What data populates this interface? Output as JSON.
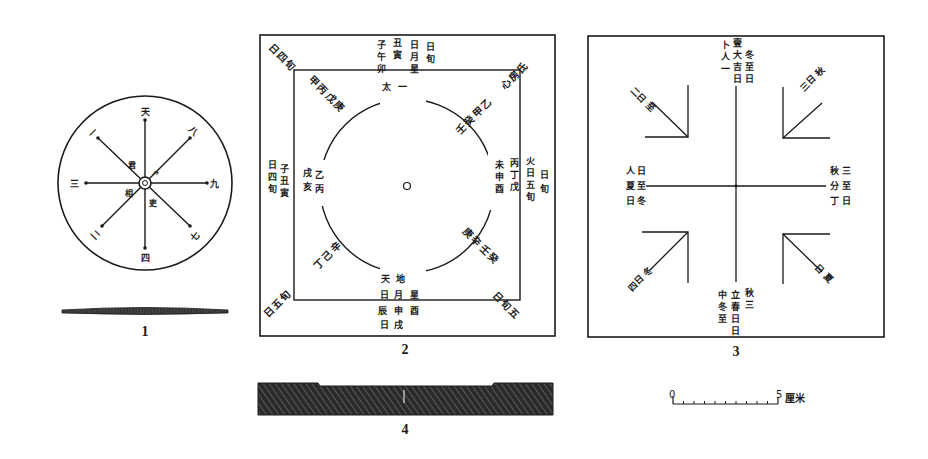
{
  "figure": {
    "ink_color": "#1a1a1a",
    "background": "#ffffff",
    "panels": [
      {
        "id": "1",
        "label": "1",
        "kind": "round board with eight radiating arms and profile section"
      },
      {
        "id": "2",
        "label": "2",
        "kind": "square board with inner square and central circle, inscribed characters"
      },
      {
        "id": "3",
        "label": "3",
        "kind": "square board with cross lines and four corner L-markers, inscribed characters"
      },
      {
        "id": "4",
        "label": "4",
        "kind": "side profile section of square board (hatched)"
      }
    ],
    "scale_bar": {
      "start_label": "0",
      "end_label": "5",
      "unit": "厘米",
      "ticks": 10
    }
  },
  "panel1": {
    "arm_end_marks": [
      "天",
      "一",
      "九",
      "二",
      "八",
      "三",
      "四",
      "七"
    ],
    "center_marks": [
      "君",
      "相",
      "吏"
    ]
  },
  "panel2": {
    "outer_corner_marks": [
      "子",
      "午",
      "卯",
      "酉"
    ],
    "ring_marks": [
      "太一",
      "天",
      "地",
      "日",
      "月"
    ]
  },
  "panel3": {
    "arm_marks": [
      "一",
      "三",
      "九",
      "七",
      "八",
      "二",
      "四",
      "六"
    ]
  }
}
